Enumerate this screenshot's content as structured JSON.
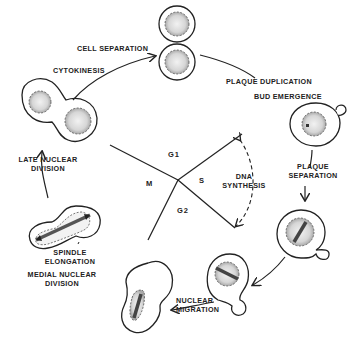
{
  "diagram": {
    "stages": [
      {
        "id": "cell_separation",
        "label": "CELL SEPARATION"
      },
      {
        "id": "cytokinesis",
        "label": "CYTOKINESIS"
      },
      {
        "id": "plaque_duplication",
        "label": "PLAQUE DUPLICATION"
      },
      {
        "id": "bud_emergence",
        "label": "BUD EMERGENCE"
      },
      {
        "id": "plaque_separation",
        "label_line1": "PLAQUE",
        "label_line2": "SEPARATION"
      },
      {
        "id": "nuclear_migration",
        "label_line1": "NUCLEAR",
        "label_line2": "MIGRATION"
      },
      {
        "id": "medial_nuclear_division",
        "label_line1": "MEDIAL NUCLEAR",
        "label_line2": "DIVISION"
      },
      {
        "id": "spindle_elongation",
        "label_line1": "SPINDLE",
        "label_line2": "ELONGATION"
      },
      {
        "id": "late_nuclear_division",
        "label_line1": "LATE NUCLEAR",
        "label_line2": "DIVISION"
      }
    ],
    "phases": {
      "g1": "G1",
      "s": "S",
      "g2": "G2",
      "m": "M"
    },
    "dna_synthesis": {
      "line1": "DNA",
      "line2": "SYNTHESIS"
    }
  }
}
